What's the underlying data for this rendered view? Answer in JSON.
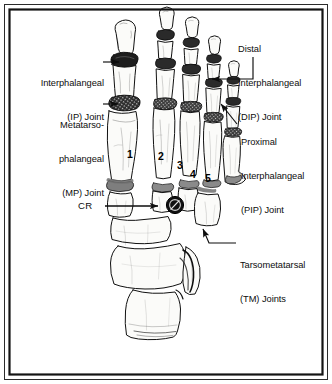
{
  "figure": {
    "kind": "anatomical-illustration",
    "border_color": "#1a1a1a",
    "background_color": "#ffffff",
    "bone_fill": "#fbfbf9",
    "bone_outline": "#111111",
    "joint_marker_color": "#1c1c1c"
  },
  "labels": {
    "ip": {
      "line1": "Interphalangeal",
      "line2": "(IP) Joint"
    },
    "mp": {
      "line1": "Metatarso-",
      "line2": "phalangeal",
      "line3": "(MP) Joint"
    },
    "dip": {
      "line1": "Distal",
      "line2": "Interphalangeal",
      "line3": "(DIP) Joint"
    },
    "pip": {
      "line1": "Proximal",
      "line2": "Interphalangeal",
      "line3": "(PIP) Joint"
    },
    "tm": {
      "line1": "Tarsometatarsal",
      "line2": "(TM) Joints"
    },
    "cr": {
      "text": "CR"
    }
  },
  "digit_numbers": [
    {
      "id": "digit-1",
      "text": "1"
    },
    {
      "id": "digit-2",
      "text": "2"
    },
    {
      "id": "digit-3",
      "text": "3"
    },
    {
      "id": "digit-4",
      "text": "4"
    },
    {
      "id": "digit-5",
      "text": "5"
    }
  ]
}
